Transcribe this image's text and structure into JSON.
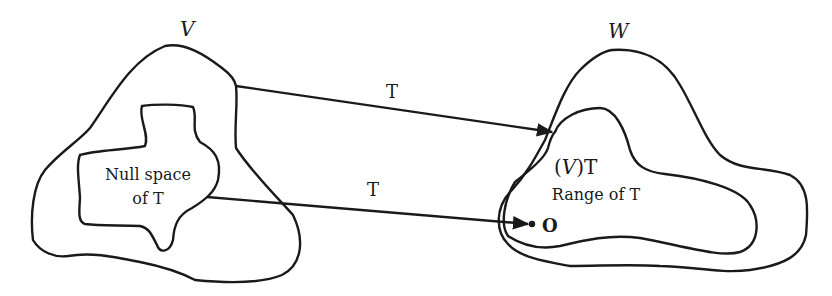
{
  "diagram": {
    "labels": {
      "domain_space": "V",
      "codomain_space": "W",
      "null_space_line1": "Null space",
      "null_space_line2": "of T",
      "arrow_upper": "T",
      "arrow_lower": "T",
      "image_open": "(",
      "image_var": "V",
      "image_close": ")T",
      "range": "Range of T",
      "zero_vector": "O"
    },
    "colors": {
      "stroke": "#1a1a1a",
      "background": "#ffffff"
    }
  }
}
